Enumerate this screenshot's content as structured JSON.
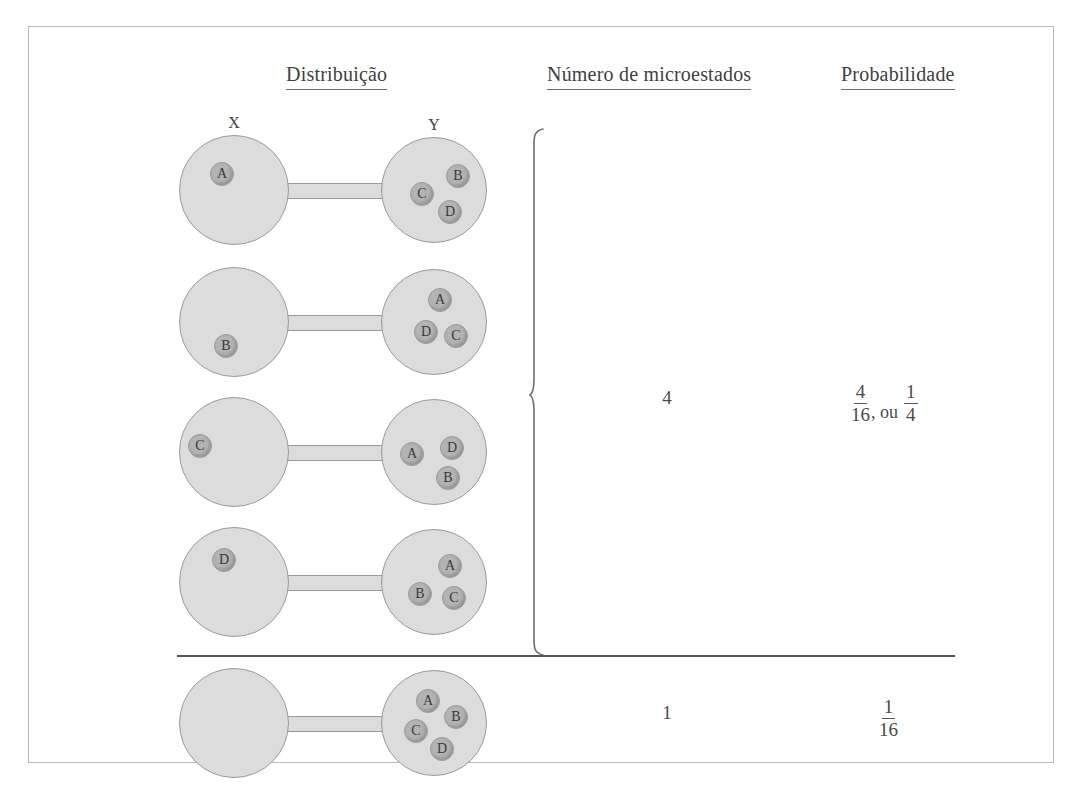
{
  "figure": {
    "headers": {
      "distribution": "Distribuição",
      "microstates": "Número de microestados",
      "probability": "Probabilidade"
    },
    "bulb_labels": {
      "left": "X",
      "right": "Y"
    },
    "rows": [
      {
        "id": "row-1",
        "left_molecules": [
          {
            "label": "A",
            "x": 30,
            "y": 26
          }
        ],
        "right_molecules": [
          {
            "label": "B",
            "x": 64,
            "y": 26
          },
          {
            "label": "C",
            "x": 28,
            "y": 44
          },
          {
            "label": "D",
            "x": 56,
            "y": 62
          }
        ]
      },
      {
        "id": "row-2",
        "left_molecules": [
          {
            "label": "B",
            "x": 34,
            "y": 66
          }
        ],
        "right_molecules": [
          {
            "label": "A",
            "x": 46,
            "y": 18
          },
          {
            "label": "D",
            "x": 32,
            "y": 50
          },
          {
            "label": "C",
            "x": 62,
            "y": 54
          }
        ]
      },
      {
        "id": "row-3",
        "left_molecules": [
          {
            "label": "C",
            "x": 8,
            "y": 36
          }
        ],
        "right_molecules": [
          {
            "label": "A",
            "x": 18,
            "y": 42
          },
          {
            "label": "D",
            "x": 58,
            "y": 36
          },
          {
            "label": "B",
            "x": 54,
            "y": 66
          }
        ]
      },
      {
        "id": "row-4",
        "left_molecules": [
          {
            "label": "D",
            "x": 32,
            "y": 20
          }
        ],
        "right_molecules": [
          {
            "label": "A",
            "x": 56,
            "y": 24
          },
          {
            "label": "B",
            "x": 26,
            "y": 52
          },
          {
            "label": "C",
            "x": 60,
            "y": 56
          }
        ]
      },
      {
        "id": "row-5",
        "left_molecules": [],
        "right_molecules": [
          {
            "label": "A",
            "x": 34,
            "y": 18
          },
          {
            "label": "B",
            "x": 62,
            "y": 34
          },
          {
            "label": "C",
            "x": 22,
            "y": 48
          },
          {
            "label": "D",
            "x": 48,
            "y": 66
          }
        ]
      }
    ],
    "groups": [
      {
        "id": "group-a",
        "microstates": "4",
        "probability": {
          "numerator_1": "4",
          "denominator_1": "16",
          "separator": ", ou",
          "numerator_2": "1",
          "denominator_2": "4"
        }
      },
      {
        "id": "group-b",
        "microstates": "1",
        "probability": {
          "numerator_1": "1",
          "denominator_1": "16"
        }
      }
    ],
    "colors": {
      "frame_border": "#b9b9b9",
      "bulb_fill": "#dcdcdc",
      "bulb_stroke": "#9a9a9a",
      "molecule_fill": "#b3b3b3",
      "divider": "#555555",
      "text": "#4a4a4a"
    }
  }
}
